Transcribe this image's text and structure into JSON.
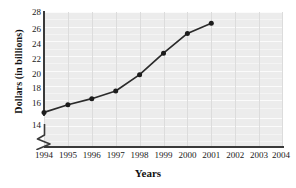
{
  "chart_data": {
    "type": "line",
    "title": "",
    "xlabel": "Years",
    "ylabel": "Dollars (in billions)",
    "x": [
      1994,
      1995,
      1996,
      1997,
      1998,
      1999,
      2000,
      2001
    ],
    "values": [
      16.3,
      17.2,
      17.9,
      18.8,
      20.7,
      23.2,
      25.5,
      26.7
    ],
    "series": [
      {
        "name": "Dollars (in billions)",
        "values": [
          16.3,
          17.2,
          17.9,
          18.8,
          20.7,
          23.2,
          25.5,
          26.7
        ]
      }
    ],
    "x_tick_labels": [
      "1994",
      "1995",
      "1996",
      "1997",
      "1998",
      "1999",
      "2000",
      "2001",
      "2002",
      "2003",
      "2004"
    ],
    "y_tick_labels": [
      "14",
      "16",
      "18",
      "20",
      "22",
      "24",
      "26",
      "28"
    ],
    "y_ticks": [
      14,
      16,
      18,
      20,
      22,
      24,
      26,
      28
    ],
    "xlim": [
      1994,
      2004
    ],
    "ylim": [
      14,
      28
    ],
    "y_axis_break": true,
    "grid": true,
    "grid_orientation": "both",
    "legend": "none",
    "marker": "filled-circle",
    "line_color": "#2b2b2b",
    "marker_color": "#1c1c1c",
    "plot_background": "#ececec",
    "gridline_color": "#fbfbfb",
    "vertical_gridline_color": "#dcdcdc",
    "axis_color": "#3a3a3a"
  },
  "axis_break_icon": "axis-break-zigzag"
}
